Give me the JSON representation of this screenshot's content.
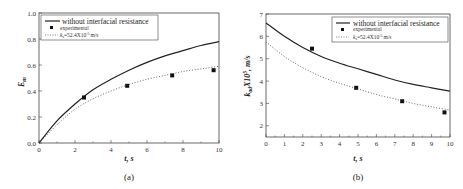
{
  "chart_data": [
    {
      "type": "line",
      "panel": "(a)",
      "xlabel": "t, s",
      "ylabel": "E_m",
      "xlim": [
        0,
        10
      ],
      "ylim": [
        0,
        1.0
      ],
      "xticks": [
        0,
        2,
        4,
        6,
        8,
        10
      ],
      "yticks": [
        0.0,
        0.2,
        0.4,
        0.6,
        0.8,
        1.0
      ],
      "legend_position": "upper left",
      "series": [
        {
          "name": "without interfacial resistance",
          "style": "solid",
          "x": [
            0,
            1,
            2,
            3,
            4,
            5,
            6,
            7,
            8,
            9,
            10
          ],
          "y": [
            0,
            0.17,
            0.3,
            0.41,
            0.49,
            0.56,
            0.62,
            0.67,
            0.71,
            0.75,
            0.78
          ]
        },
        {
          "name": "experimental",
          "style": "marker-square",
          "x": [
            2.5,
            4.9,
            7.4,
            9.7
          ],
          "y": [
            0.35,
            0.44,
            0.52,
            0.56
          ]
        },
        {
          "name": "k_s=52.4X10^-5 m/s",
          "style": "dotted",
          "x": [
            0,
            1,
            2,
            3,
            4,
            5,
            6,
            7,
            8,
            9,
            10
          ],
          "y": [
            0,
            0.14,
            0.26,
            0.34,
            0.4,
            0.45,
            0.49,
            0.52,
            0.55,
            0.57,
            0.59
          ]
        }
      ]
    },
    {
      "type": "line",
      "panel": "(b)",
      "xlabel": "t, s",
      "ylabel": "k_ad X10^5, m/s",
      "xlim": [
        0,
        10
      ],
      "ylim": [
        1.5,
        7
      ],
      "xticks": [
        0,
        1,
        2,
        3,
        4,
        5,
        6,
        7,
        8,
        9,
        10
      ],
      "yticks": [
        2,
        3,
        4,
        5,
        6,
        7
      ],
      "legend_position": "upper right",
      "series": [
        {
          "name": "without interfacial resistance",
          "style": "solid",
          "x": [
            0,
            1,
            2,
            3,
            4,
            5,
            6,
            7,
            8,
            9,
            10
          ],
          "y": [
            6.6,
            6.0,
            5.5,
            5.1,
            4.8,
            4.55,
            4.3,
            4.05,
            3.85,
            3.7,
            3.55
          ]
        },
        {
          "name": "experimental",
          "style": "marker-square",
          "x": [
            2.5,
            4.9,
            7.4,
            9.7
          ],
          "y": [
            5.45,
            3.7,
            3.1,
            2.6
          ]
        },
        {
          "name": "k_s=52.4X10^-5 m/s",
          "style": "dotted",
          "x": [
            0,
            1,
            2,
            3,
            4,
            5,
            6,
            7,
            8,
            9,
            10
          ],
          "y": [
            5.75,
            5.1,
            4.6,
            4.2,
            3.9,
            3.65,
            3.4,
            3.2,
            3.0,
            2.85,
            2.7
          ]
        }
      ]
    }
  ],
  "panels": {
    "a": {
      "caption": "(a)",
      "xlabel": "t, s",
      "ylabel_main": "E",
      "ylabel_sub": "m",
      "legend": {
        "line": "without interfacial resistance",
        "marker": "experimental",
        "dotted_pre": "k",
        "dotted_sub": "s",
        "dotted_post": "=52.4X10",
        "dotted_sup": "-5",
        "dotted_unit": "m/s"
      }
    },
    "b": {
      "caption": "(b)",
      "xlabel": "t, s",
      "ylabel_main": "k",
      "ylabel_sub": "ad",
      "ylabel_post": "X10",
      "ylabel_sup": "5",
      "ylabel_unit": ", m/s",
      "legend": {
        "line": "without interfacial resistance",
        "marker": "experimental",
        "dotted_pre": "k",
        "dotted_sub": "s",
        "dotted_post": "=52.4X10",
        "dotted_sup": "-5",
        "dotted_unit": "m/s"
      }
    }
  }
}
